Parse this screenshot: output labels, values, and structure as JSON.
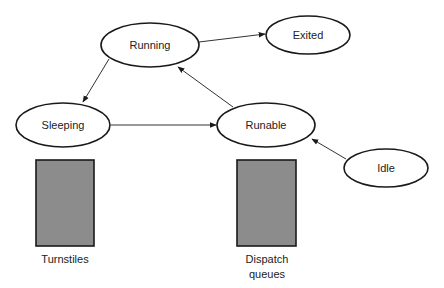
{
  "diagram": {
    "type": "state-transition",
    "colors": {
      "stroke": "#1a1a1a",
      "edge": "#333333",
      "box_fill": "#8c8c8c",
      "background": "#ffffff"
    },
    "nodes": [
      {
        "id": "running",
        "label": "Running",
        "cx": 150,
        "cy": 45,
        "rx": 49,
        "ry": 22
      },
      {
        "id": "exited",
        "label": "Exited",
        "cx": 308,
        "cy": 35,
        "rx": 42,
        "ry": 19
      },
      {
        "id": "sleeping",
        "label": "Sleeping",
        "cx": 63,
        "cy": 125,
        "rx": 47,
        "ry": 22
      },
      {
        "id": "runable",
        "label": "Runable",
        "cx": 266,
        "cy": 125,
        "rx": 49,
        "ry": 22
      },
      {
        "id": "idle",
        "label": "Idle",
        "cx": 386,
        "cy": 168,
        "rx": 42,
        "ry": 19
      }
    ],
    "edges": [
      {
        "from": "running",
        "to": "exited"
      },
      {
        "from": "running",
        "to": "sleeping"
      },
      {
        "from": "sleeping",
        "to": "runable"
      },
      {
        "from": "runable",
        "to": "running"
      },
      {
        "from": "idle",
        "to": "runable"
      }
    ],
    "boxes": [
      {
        "id": "turnstiles",
        "label_lines": [
          "Turnstiles"
        ],
        "x": 36,
        "y": 160,
        "w": 58,
        "h": 86
      },
      {
        "id": "dispatch-queues",
        "label_lines": [
          "Dispatch",
          "queues"
        ],
        "x": 237,
        "y": 160,
        "w": 59,
        "h": 86
      }
    ]
  }
}
